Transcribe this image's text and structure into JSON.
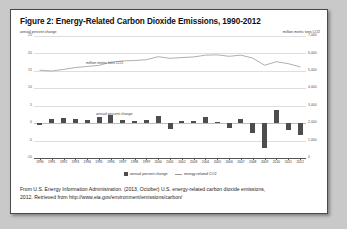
{
  "figure": {
    "title": "Figure 2: Energy-Related Carbon Dioxide Emissions, 1990-2012",
    "source_line_1": "From U.S. Energy Information Administration. (2013, October) U.S. energy-related carbon dioxide emissions,",
    "source_line_2": "2012. Retrieved from http://www.eia.gov/environment/emissions/carbon/"
  },
  "labels": {
    "left_axis_caption": "annual percent change",
    "right_axis_caption": "million metric tons CO2",
    "inplot_line_label": "million metric tons CO2",
    "inplot_bars_label": "annual percent change",
    "legend_bars": "annual percent change",
    "legend_line": "energy-related CO2"
  },
  "colors": {
    "bar": "#4d4d4d",
    "line": "#9a9a9a",
    "grid": "#dedede",
    "axis": "#555555",
    "card_border": "#4a4a4a",
    "page_background": "#c9c9c9"
  },
  "chart_data": {
    "type": "bar",
    "title": "Figure 2: Energy-Related Carbon Dioxide Emissions, 1990-2012",
    "xlabel": "",
    "ylabel": "annual percent change",
    "y2label": "million metric tons CO2",
    "grid": true,
    "legend_position": "bottom",
    "categories": [
      "1990",
      "1991",
      "1992",
      "1993",
      "1994",
      "1995",
      "1996",
      "1997",
      "1998",
      "1999",
      "2000",
      "2001",
      "2002",
      "2003",
      "2004",
      "2005",
      "2006",
      "2007",
      "2008",
      "2009",
      "2010",
      "2011",
      "2012"
    ],
    "ylim": [
      -10,
      25
    ],
    "yticks": [
      25,
      20,
      15,
      10,
      5,
      0,
      -5,
      -10
    ],
    "ytick_labels": [
      "25",
      "20",
      "15",
      "10",
      "5",
      "0",
      "-5",
      "-10"
    ],
    "y2lim": [
      0,
      7000
    ],
    "y2ticks": [
      7000,
      6000,
      5000,
      4000,
      3000,
      2000,
      1000,
      0
    ],
    "y2tick_labels": [
      "7,000",
      "6,000",
      "5,000",
      "4,000",
      "3,000",
      "2,000",
      "1,000",
      "0"
    ],
    "series": [
      {
        "name": "annual percent change",
        "type": "bar",
        "axis": "left",
        "values": [
          -0.6,
          1.3,
          1.6,
          1.1,
          0.9,
          1.8,
          2.4,
          0.9,
          0.5,
          0.8,
          2.1,
          -1.6,
          0.6,
          0.7,
          1.7,
          0.3,
          -1.4,
          1.1,
          -2.9,
          -7.1,
          3.8,
          -2.0,
          -3.4
        ]
      },
      {
        "name": "energy-related CO2",
        "type": "line",
        "axis": "right",
        "values": [
          5039,
          4990,
          5086,
          5190,
          5256,
          5315,
          5500,
          5570,
          5593,
          5640,
          5812,
          5720,
          5762,
          5798,
          5900,
          5918,
          5836,
          5900,
          5730,
          5322,
          5525,
          5413,
          5230
        ]
      }
    ]
  }
}
